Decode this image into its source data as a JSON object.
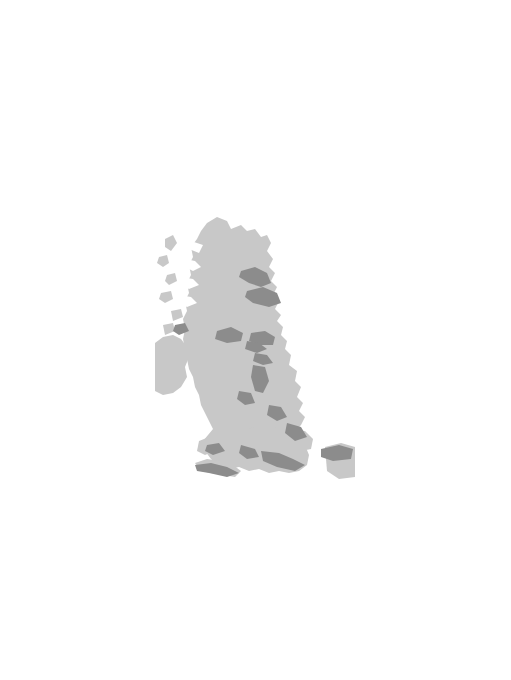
{
  "figure": {
    "axis_label_y": "Sea level (m)",
    "axis_label_x_main": "Time (ka",
    "axis_label_x_sub": "BP",
    "axis_label_x_close": ")",
    "line_color": "#1a1a1a",
    "map_land_color": "#c8c8c8",
    "map_shade_color": "#8c8c8c",
    "zero_line_color": "#9a9a9a"
  },
  "map": {
    "name": "british-isles-map",
    "labels": [
      {
        "id": "montrose",
        "text": "Montrose",
        "x": 262,
        "y": 255,
        "dot": false
      },
      {
        "id": "tay-f",
        "text": "Tay F",
        "x": 256,
        "y": 275,
        "dot": false
      },
      {
        "id": "forth-f",
        "text": "Forth F",
        "x": 258,
        "y": 297,
        "dot": false
      },
      {
        "id": "lochgilphead",
        "text": "Lochgilphead",
        "x": 152,
        "y": 290,
        "dot": true,
        "dotx": 210,
        "doty": 287
      },
      {
        "id": "girvan",
        "text": "Girvan",
        "x": 186,
        "y": 314,
        "dot": true,
        "dotx": 216,
        "doty": 316
      },
      {
        "id": "kirkcudbright",
        "text": "Kirkcudbright",
        "x": 170,
        "y": 327,
        "dot": true,
        "dotx": 229,
        "doty": 325
      },
      {
        "id": "millom",
        "text": "Millom",
        "x": 230,
        "y": 334,
        "dot": true,
        "dotx": 247,
        "doty": 341
      },
      {
        "id": "southport",
        "text": "Southport",
        "x": 201,
        "y": 358,
        "dot": true,
        "dotx": 248,
        "doty": 356
      },
      {
        "id": "crosby",
        "text": "Crosby",
        "x": 214,
        "y": 370,
        "dot": true,
        "dotx": 252,
        "doty": 368
      },
      {
        "id": "se-channel",
        "text": "SE Channel",
        "x": 261,
        "y": 455,
        "dot": false
      }
    ]
  },
  "chart_data": [
    {
      "id": "glencarse",
      "type": "line",
      "title": "Glencarse",
      "xlabel": "Time (ka BP)",
      "ylabel": "Sea level (m)",
      "show_ylabel": true,
      "show_xlabel": true,
      "xlim": [
        16,
        0
      ],
      "ylim": [
        -10,
        45
      ],
      "xticks": [
        16,
        8,
        0
      ],
      "xtick_labels": [
        "16",
        "8",
        "0"
      ],
      "xminor_step": 2,
      "yticks": [
        -10,
        0,
        20,
        40
      ],
      "ytick_labels": [
        "-10",
        "0",
        "20",
        "40"
      ],
      "zero_line": true,
      "x": [
        15.0,
        14.2,
        13.3,
        12.3,
        11.4,
        10.6,
        9.8,
        9.1,
        8.5,
        7.9,
        7.2,
        6.4,
        5.6,
        4.8,
        4.0
      ],
      "y": [
        41.0,
        33.0,
        26.0,
        19.5,
        14.0,
        9.0,
        4.5,
        1.5,
        0.0,
        -0.8,
        -1.2,
        0.5,
        2.6,
        4.6,
        6.6
      ],
      "yerr": [
        5.0,
        3.5,
        4.0,
        4.0,
        4.0,
        4.5,
        5.0,
        2.0,
        1.0,
        1.0,
        1.0,
        0.8,
        0.6,
        0.6,
        0.6
      ]
    },
    {
      "id": "clyde-firth",
      "type": "line",
      "title": "Clyde Firth",
      "xlim": [
        14,
        0
      ],
      "ylim": [
        0,
        41
      ],
      "xticks": [
        14,
        8,
        0
      ],
      "xtick_labels": [
        "14",
        "8",
        "0"
      ],
      "xminor_step": 2,
      "yticks": [
        0,
        20,
        40
      ],
      "ytick_labels": [
        "0",
        "20",
        "40"
      ],
      "zero_line": false,
      "x": [
        13.4,
        13.1,
        12.3,
        11.4,
        10.5,
        9.9,
        9.3,
        8.7,
        8.1,
        7.6,
        7.0,
        6.4,
        5.9,
        5.3,
        4.8,
        4.2
      ],
      "y": [
        30.0,
        35.0,
        24.0,
        18.0,
        12.0,
        9.5,
        7.2,
        5.0,
        4.2,
        3.5,
        3.6,
        5.5,
        8.0,
        10.0,
        10.5,
        9.6
      ],
      "yerr": [
        4.0,
        6.0,
        3.0,
        2.5,
        2.5,
        2.5,
        2.5,
        2.5,
        2.0,
        2.0,
        2.0,
        2.0,
        1.6,
        1.4,
        1.4,
        1.4
      ]
    },
    {
      "id": "beauly-firth",
      "type": "line",
      "title": "Beauly Firth",
      "xlim": [
        16,
        0
      ],
      "ylim": [
        0,
        34
      ],
      "xticks": [
        16,
        8,
        0
      ],
      "xtick_labels": [
        "16",
        "8",
        "0"
      ],
      "xminor_step": 2,
      "yticks": [
        0,
        20
      ],
      "ytick_labels": [
        "0",
        "20"
      ],
      "zero_line": false,
      "x": [
        14.4,
        13.6,
        12.8,
        12.2,
        11.6,
        11.2,
        10.8,
        10.4,
        10.1,
        9.8,
        9.4,
        9.0,
        8.6,
        8.2,
        7.8,
        7.0,
        6.3,
        5.6,
        4.9,
        4.2,
        3.6
      ],
      "y": [
        31.0,
        24.0,
        17.5,
        14.0,
        8.0,
        3.5,
        2.0,
        4.5,
        2.5,
        6.5,
        3.5,
        2.0,
        3.0,
        1.5,
        2.5,
        4.0,
        5.5,
        6.5,
        6.0,
        4.0,
        2.5
      ],
      "yerr": [
        3.0,
        2.6,
        2.2,
        2.0,
        2.6,
        2.2,
        2.6,
        3.0,
        2.6,
        3.0,
        2.4,
        2.2,
        2.4,
        2.0,
        1.8,
        1.6,
        1.6,
        1.6,
        1.8,
        2.4,
        2.2
      ]
    },
    {
      "id": "arnprior",
      "type": "line",
      "title": "Arnprior",
      "xlim": [
        16,
        0
      ],
      "ylim": [
        -2,
        46
      ],
      "xticks": [
        16,
        8,
        0
      ],
      "xtick_labels": [
        "16",
        "8",
        "0"
      ],
      "xminor_step": 2,
      "yticks": [
        0,
        20,
        40
      ],
      "ytick_labels": [
        "0",
        "20",
        "40"
      ],
      "zero_line": true,
      "x": [
        14.3,
        13.6,
        12.8,
        12.0,
        11.3,
        10.6,
        10.1,
        9.6,
        9.2,
        8.8,
        8.4,
        8.0,
        7.5,
        7.0,
        6.5,
        6.0,
        5.5,
        5.0,
        4.4,
        3.8,
        3.2,
        2.6,
        2.0,
        1.4,
        0.7
      ],
      "y": [
        43.0,
        36.0,
        30.0,
        24.0,
        17.5,
        9.0,
        5.5,
        7.5,
        10.5,
        6.5,
        4.5,
        5.5,
        4.5,
        6.0,
        8.0,
        10.0,
        11.5,
        12.5,
        12.0,
        11.0,
        9.5,
        7.5,
        5.5,
        3.5,
        0.5
      ],
      "yerr": [
        3.0,
        2.0,
        1.8,
        1.6,
        1.8,
        2.6,
        3.0,
        3.0,
        3.0,
        2.4,
        2.2,
        2.2,
        2.0,
        1.8,
        1.8,
        2.0,
        2.0,
        1.8,
        1.6,
        1.4,
        1.4,
        1.2,
        1.2,
        1.0,
        1.0
      ]
    },
    {
      "id": "morecambe-bay",
      "type": "line",
      "title": "Morecambe Bay",
      "xlim": [
        10,
        0
      ],
      "ylim": [
        -24,
        2
      ],
      "xticks": [
        10,
        6,
        2,
        0
      ],
      "xtick_labels": [
        "10",
        "6",
        "2",
        "0"
      ],
      "xminor_step": 1,
      "yticks": [
        0,
        -10,
        -20
      ],
      "ytick_labels": [
        "0",
        "-10",
        "-20"
      ],
      "zero_line": true,
      "x": [
        9.6,
        9.3,
        9.0,
        8.5,
        8.0,
        7.5,
        7.1,
        6.7,
        6.4,
        6.1,
        5.7,
        5.2,
        4.6,
        3.8,
        3.0,
        2.2
      ],
      "y": [
        -21.5,
        -20.0,
        -19.5,
        -15.0,
        -9.0,
        -5.0,
        -3.0,
        -1.8,
        -0.8,
        0.0,
        0.2,
        0.3,
        0.1,
        -0.1,
        -0.3,
        -0.6
      ],
      "yerr": [
        1.8,
        1.4,
        1.4,
        1.2,
        1.2,
        1.2,
        1.2,
        1.2,
        1.0,
        1.0,
        1.0,
        1.0,
        0.9,
        0.9,
        0.9,
        0.9
      ]
    },
    {
      "id": "cardigan-bay",
      "type": "line",
      "title": "Cardigan Bay",
      "xlim": [
        9.5,
        0
      ],
      "ylim": [
        -30,
        1
      ],
      "xticks": [
        8,
        4,
        0
      ],
      "xtick_labels": [
        "8",
        "4",
        "0"
      ],
      "xminor_step": 1,
      "yticks": [
        0,
        -10,
        -20,
        -30
      ],
      "ytick_labels": [
        "0",
        "-10",
        "-20",
        "-30"
      ],
      "zero_line": false,
      "x": [
        8.6,
        8.2,
        7.7,
        7.2,
        6.8,
        6.4,
        6.1,
        5.7,
        5.3,
        4.9,
        4.5,
        4.1,
        3.6,
        3.1,
        2.5,
        1.9,
        1.3,
        0.7
      ],
      "y": [
        -26.5,
        -22.0,
        -17.0,
        -11.5,
        -6.0,
        -4.4,
        -4.0,
        -3.6,
        -3.3,
        -3.0,
        -2.7,
        -2.4,
        -2.0,
        -1.7,
        -1.4,
        -1.0,
        -0.7,
        -0.4
      ],
      "yerr": [
        3.5,
        3.0,
        2.6,
        2.4,
        2.0,
        1.6,
        1.4,
        1.4,
        1.3,
        1.3,
        1.2,
        1.2,
        1.1,
        1.0,
        1.0,
        0.9,
        0.8,
        0.7
      ]
    },
    {
      "id": "humber-estuary",
      "type": "line",
      "title": "Humber Estuary",
      "xlim": [
        8,
        0
      ],
      "ylim": [
        -20,
        0
      ],
      "xticks": [
        8,
        4,
        0
      ],
      "xtick_labels": [
        "8",
        "4",
        "0"
      ],
      "xminor_step": 1,
      "yticks": [
        0,
        -10,
        -20
      ],
      "ytick_labels": [
        "0",
        "-10",
        "-20"
      ],
      "zero_line": false,
      "x": [
        6.9,
        6.5,
        6.0,
        5.4,
        4.9,
        4.3,
        3.6,
        3.1,
        2.6
      ],
      "y": [
        -14.7,
        -14.0,
        -11.8,
        -10.0,
        -8.3,
        -7.0,
        -6.0,
        -5.0,
        -4.2
      ],
      "yerr": [
        1.8,
        1.8,
        1.8,
        1.8,
        2.0,
        2.0,
        2.2,
        2.4,
        2.4
      ]
    },
    {
      "id": "somerset",
      "type": "line",
      "title": "Somerset",
      "xlim": [
        9.5,
        0
      ],
      "ylim": [
        -30,
        0
      ],
      "xticks": [
        8,
        4,
        0
      ],
      "xtick_labels": [
        "8",
        "4",
        "0"
      ],
      "xminor_step": 1,
      "yticks": [
        0,
        -10,
        -20,
        -30
      ],
      "ytick_labels": [
        "0",
        "-10",
        "-20",
        "-30"
      ],
      "zero_line": false,
      "x": [
        8.3,
        8.0,
        7.6,
        7.2,
        6.9,
        6.6,
        6.3,
        5.9,
        5.5,
        5.1,
        4.7,
        4.3,
        3.9,
        3.5,
        3.1
      ],
      "y": [
        -25.0,
        -21.5,
        -17.5,
        -14.5,
        -12.0,
        -10.0,
        -8.3,
        -7.0,
        -6.0,
        -5.3,
        -4.7,
        -4.2,
        -3.8,
        -3.4,
        -3.2
      ],
      "yerr": [
        2.4,
        1.8,
        1.4,
        1.2,
        1.2,
        1.2,
        1.2,
        1.2,
        1.2,
        1.2,
        1.2,
        1.2,
        1.2,
        1.2,
        1.2
      ]
    },
    {
      "id": "fenland",
      "type": "line",
      "title": "Fenland",
      "xlim": [
        8,
        0
      ],
      "ylim": [
        -15,
        0
      ],
      "xticks": [
        8,
        4,
        0
      ],
      "xtick_labels": [
        "8",
        "4",
        "0"
      ],
      "xminor_step": 1,
      "yticks": [
        0,
        -5,
        -10,
        -15
      ],
      "ytick_labels": [
        "0",
        "-5",
        "-10",
        "-15"
      ],
      "zero_line": false,
      "x": [
        6.6,
        6.3,
        5.9,
        5.5,
        5.1,
        4.7,
        4.3,
        3.9,
        3.5,
        3.0,
        2.5,
        2.0
      ],
      "y": [
        -11.5,
        -10.7,
        -9.8,
        -8.6,
        -7.1,
        -5.6,
        -4.6,
        -3.9,
        -2.8,
        -2.7,
        -2.8,
        -2.7
      ],
      "yerr": [
        1.6,
        1.5,
        1.4,
        1.3,
        1.2,
        1.2,
        1.2,
        1.2,
        1.2,
        1.3,
        1.4,
        1.6
      ]
    },
    {
      "id": "south-west-channel-coast",
      "type": "line",
      "title": "South-west Channel coast",
      "title_line1": "South-west",
      "title_line2": "Channel coast",
      "xlabel": "Time (ka BP)",
      "ylabel": "Sea level (m)",
      "show_ylabel": true,
      "show_xlabel": true,
      "xlim": [
        9.5,
        0
      ],
      "ylim": [
        -40,
        0
      ],
      "xticks": [
        8,
        4,
        0
      ],
      "xtick_labels": [
        "8",
        "4",
        "0"
      ],
      "xminor_step": 1,
      "yticks": [
        0,
        -20,
        -40
      ],
      "ytick_labels": [
        "0",
        "-20",
        "-40"
      ],
      "zero_line": false,
      "x": [
        8.8,
        8.4,
        8.0,
        7.6,
        7.2,
        6.7,
        6.2,
        5.7,
        5.2,
        4.7,
        4.2,
        3.7,
        3.2,
        2.7,
        2.2,
        1.7,
        1.2,
        0.8
      ],
      "y": [
        -34.0,
        -27.0,
        -22.0,
        -17.5,
        -13.5,
        -9.5,
        -7.5,
        -6.0,
        -5.2,
        -4.5,
        -4.0,
        -3.5,
        -3.2,
        -2.8,
        -2.5,
        -2.2,
        -2.0,
        -1.8
      ],
      "yerr": [
        4.0,
        2.8,
        2.2,
        1.8,
        1.6,
        1.6,
        1.6,
        1.6,
        1.6,
        1.6,
        1.6,
        1.6,
        1.6,
        1.6,
        1.6,
        1.6,
        1.6,
        1.6
      ]
    },
    {
      "id": "thames-estuary",
      "type": "line",
      "title": "Thames Estuary",
      "xlim": [
        9.5,
        0
      ],
      "ylim": [
        -30,
        0
      ],
      "xticks": [
        8,
        4,
        0
      ],
      "xtick_labels": [
        "8",
        "4",
        "0"
      ],
      "xminor_step": 1,
      "yticks": [
        0,
        -10,
        -20,
        -30
      ],
      "ytick_labels": [
        "0",
        "-10",
        "-20",
        "-30"
      ],
      "zero_line": false,
      "x": [
        8.5,
        8.2,
        7.9,
        7.5,
        7.1,
        6.7,
        6.3,
        5.9,
        5.4,
        4.9,
        4.4,
        3.9,
        3.4,
        2.9,
        2.4,
        1.9,
        1.4
      ],
      "y": [
        -29.0,
        -24.0,
        -19.5,
        -15.5,
        -12.5,
        -10.0,
        -8.2,
        -6.8,
        -5.5,
        -4.5,
        -3.8,
        -3.2,
        -2.7,
        -2.3,
        -2.0,
        -1.7,
        -1.4
      ],
      "yerr": [
        2.0,
        1.8,
        1.6,
        1.6,
        1.6,
        1.6,
        1.6,
        1.6,
        1.6,
        1.6,
        1.5,
        1.5,
        1.4,
        1.4,
        1.3,
        1.3,
        1.2
      ]
    }
  ],
  "leaders": [
    {
      "id": "leader-glencarse",
      "x1": 188,
      "y1": 110,
      "x2": 232,
      "y2": 245
    },
    {
      "id": "leader-clyde",
      "x1": 147,
      "y1": 225,
      "x2": 210,
      "y2": 285
    },
    {
      "id": "leader-beauly",
      "x1": 280,
      "y1": 222,
      "x2": 250,
      "y2": 240
    },
    {
      "id": "leader-arnprior",
      "x1": 322,
      "y1": 290,
      "x2": 272,
      "y2": 295
    },
    {
      "id": "leader-morecambe",
      "x1": 152,
      "y1": 338,
      "x2": 248,
      "y2": 352
    },
    {
      "id": "leader-cardigan",
      "x1": 168,
      "y1": 450,
      "x2": 226,
      "y2": 415
    },
    {
      "id": "leader-humber",
      "x1": 358,
      "y1": 360,
      "x2": 300,
      "y2": 392
    },
    {
      "id": "leader-somerset",
      "x1": 182,
      "y1": 512,
      "x2": 235,
      "y2": 470
    },
    {
      "id": "leader-fenland",
      "x1": 372,
      "y1": 470,
      "x2": 312,
      "y2": 430
    },
    {
      "id": "leader-swchannel",
      "x1": 250,
      "y1": 552,
      "x2": 243,
      "y2": 480
    },
    {
      "id": "leader-thames",
      "x1": 382,
      "y1": 560,
      "x2": 318,
      "y2": 462
    }
  ],
  "caption": {
    "figure_number": "5.3",
    "text": "Sea level data showing ..."
  }
}
